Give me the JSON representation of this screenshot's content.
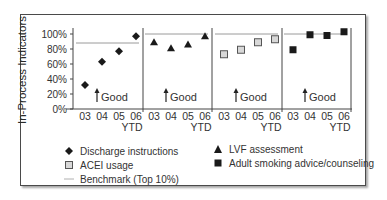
{
  "chart_data": {
    "type": "scatter",
    "title": "",
    "ylabel": "In-Process Indicators",
    "xlabel": "",
    "ylim": [
      0,
      100
    ],
    "y_ticks": [
      "0%",
      "20%",
      "40%",
      "60%",
      "80%",
      "100%"
    ],
    "categories": [
      "03",
      "04",
      "05",
      "06 YTD"
    ],
    "annotation": "↑ Good",
    "grid": false,
    "legend_position": "bottom",
    "panels": [
      {
        "series": "Discharge instructions",
        "marker": "diamond",
        "values": [
          32,
          63,
          77,
          97
        ],
        "benchmark": 88
      },
      {
        "series": "LVF assessment",
        "marker": "triangle",
        "values": [
          89,
          81,
          86,
          97
        ],
        "benchmark": 100
      },
      {
        "series": "ACEI usage",
        "marker": "open-square",
        "values": [
          73,
          79,
          89,
          93
        ],
        "benchmark": 100
      },
      {
        "series": "Adult smoking advice/counseling",
        "marker": "filled-square",
        "values": [
          79,
          99,
          98,
          103
        ],
        "benchmark": 100
      }
    ],
    "legend": [
      {
        "label": "Discharge instructions",
        "marker": "diamond"
      },
      {
        "label": "LVF assessment",
        "marker": "triangle"
      },
      {
        "label": "ACEI usage",
        "marker": "open-square"
      },
      {
        "label": "Adult smoking advice/counseling",
        "marker": "filled-square"
      },
      {
        "label": "Benchmark (Top 10%)",
        "marker": "line"
      }
    ]
  },
  "labels": {
    "ylabel": "In-Process Indicators",
    "good": "Good",
    "ytd": "YTD",
    "x": [
      "03",
      "04",
      "05",
      "06"
    ],
    "y": [
      "100%",
      "80%",
      "60%",
      "40%",
      "20%",
      "0%"
    ],
    "legend": {
      "discharge": "Discharge instructions",
      "lvf": "LVF assessment",
      "acei": "ACEI usage",
      "smoking": "Adult smoking advice/counseling",
      "benchmark": "Benchmark (Top 10%)"
    }
  },
  "colors": {
    "marker": "#1a1a1a",
    "benchmark": "#9a9a9a",
    "axis": "#444444",
    "open_square_fill": "#d8d8d8"
  }
}
